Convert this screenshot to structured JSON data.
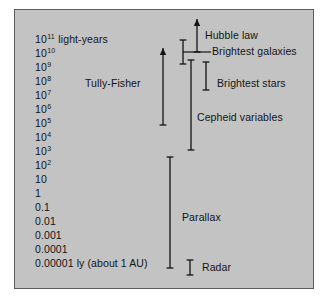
{
  "figure": {
    "background_color": "#c3c3c3",
    "border_color": "#5d5d5d",
    "ink_color": "#141414"
  },
  "scale": {
    "unit_text": "light-years",
    "ticks": [
      {
        "mantissa": "10",
        "exponent": "11",
        "y": 33
      },
      {
        "mantissa": "10",
        "exponent": "10",
        "y": 47
      },
      {
        "mantissa": "10",
        "exponent": "9",
        "y": 61
      },
      {
        "mantissa": "10",
        "exponent": "8",
        "y": 75
      },
      {
        "mantissa": "10",
        "exponent": "7",
        "y": 89
      },
      {
        "mantissa": "10",
        "exponent": "6",
        "y": 103
      },
      {
        "mantissa": "10",
        "exponent": "5",
        "y": 117
      },
      {
        "mantissa": "10",
        "exponent": "4",
        "y": 131
      },
      {
        "mantissa": "10",
        "exponent": "3",
        "y": 145
      },
      {
        "mantissa": "10",
        "exponent": "2",
        "y": 159
      },
      {
        "mantissa": "10",
        "exponent": "",
        "y": 173
      },
      {
        "mantissa": "1",
        "exponent": "",
        "y": 187
      },
      {
        "mantissa": "0.1",
        "exponent": "",
        "y": 201
      },
      {
        "mantissa": "0.01",
        "exponent": "",
        "y": 215
      },
      {
        "mantissa": "0.001",
        "exponent": "",
        "y": 229
      },
      {
        "mantissa": "0.0001",
        "exponent": "",
        "y": 243
      },
      {
        "mantissa": "0.00001 ly (about 1 AU)",
        "exponent": "",
        "y": 257
      }
    ]
  },
  "methods": [
    {
      "id": "tully-fisher",
      "label": "Tully-Fisher",
      "label_x": 70,
      "label_y": 74,
      "bar_x": 148,
      "bar_top": 38,
      "bar_bottom": 115,
      "top_cap": "arrow",
      "bottom_cap": "flat"
    },
    {
      "id": "hubble-law",
      "label": "Hubble law",
      "label_x": 190,
      "label_y": 26,
      "bar_x": 182,
      "bar_top": 9,
      "bar_bottom": 42,
      "top_cap": "arrow",
      "bottom_cap": "flat"
    },
    {
      "id": "brightest-galaxies",
      "label": "Brightest galaxies",
      "label_x": 197,
      "label_y": 42,
      "bar_x": 168,
      "bar_top": 30,
      "bar_bottom": 54,
      "top_cap": "flat",
      "bottom_cap": "flat",
      "leader_from_x": 168,
      "leader_to_x": 196,
      "leader_y": 42
    },
    {
      "id": "brightest-stars",
      "label": "Brightest stars",
      "label_x": 202,
      "label_y": 74,
      "bar_x": 191,
      "bar_top": 52,
      "bar_bottom": 80,
      "top_cap": "flat",
      "bottom_cap": "flat"
    },
    {
      "id": "cepheid-variables",
      "label": "Cepheid variables",
      "label_x": 182,
      "label_y": 108,
      "bar_x": 176,
      "bar_top": 50,
      "bar_bottom": 140,
      "top_cap": "flat",
      "bottom_cap": "flat"
    },
    {
      "id": "parallax",
      "label": "Parallax",
      "label_x": 167,
      "label_y": 208,
      "bar_x": 155,
      "bar_top": 147,
      "bar_bottom": 258,
      "top_cap": "flat",
      "bottom_cap": "flat"
    },
    {
      "id": "radar",
      "label": "Radar",
      "label_x": 187,
      "label_y": 258,
      "bar_x": 175,
      "bar_top": 250,
      "bar_bottom": 265,
      "top_cap": "flat",
      "bottom_cap": "flat"
    }
  ]
}
